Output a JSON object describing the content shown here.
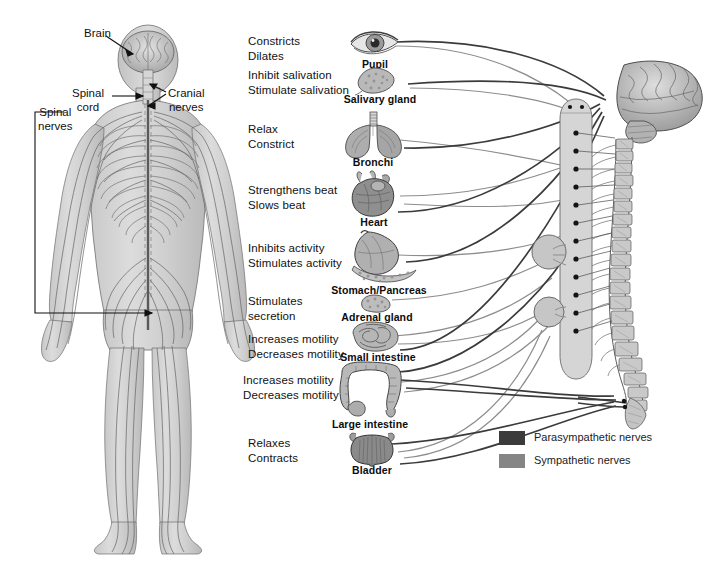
{
  "figure": {
    "body_figure": {
      "name": "human-nervous-system-posterior-view",
      "labels": [
        {
          "id": "brain",
          "text": "Brain",
          "x": 84,
          "y": 26
        },
        {
          "id": "spinal-cord",
          "text": "Spinal\ncord",
          "x": 79,
          "y": 86
        },
        {
          "id": "cranial-nerves",
          "text": "Cranial\nnerves",
          "x": 170,
          "y": 86
        },
        {
          "id": "spinal-nerves",
          "text": "Spinal\nnerves",
          "x": 40,
          "y": 105
        }
      ]
    },
    "organs": [
      {
        "id": "pupil",
        "name": "Pupil",
        "effects": [
          "Constricts",
          "Dilates"
        ],
        "icon": "eye-icon",
        "label_y": 36,
        "organ_y": 32,
        "name_y": 61
      },
      {
        "id": "salivary-gland",
        "name": "Salivary gland",
        "effects": [
          "Inhibit salivation",
          "Stimulate salivation"
        ],
        "icon": "salivary-gland-icon",
        "label_y": 70,
        "organ_y": 66,
        "name_y": 96
      },
      {
        "id": "bronchi",
        "name": "Bronchi",
        "effects": [
          "Relax",
          "Constrict"
        ],
        "icon": "lungs-icon",
        "label_y": 124,
        "organ_y": 112,
        "name_y": 160
      },
      {
        "id": "heart",
        "name": "Heart",
        "effects": [
          "Strengthens beat",
          "Slows beat"
        ],
        "icon": "heart-icon",
        "label_y": 185,
        "organ_y": 172,
        "name_y": 219
      },
      {
        "id": "stomach-pancreas",
        "name": "Stomach/Pancreas",
        "effects": [
          "Inhibits activity",
          "Stimulates activity"
        ],
        "icon": "stomach-icon",
        "label_y": 243,
        "organ_y": 233,
        "name_y": 288
      },
      {
        "id": "adrenal-gland",
        "name": "Adrenal gland",
        "effects": [
          "Stimulates",
          "secretion"
        ],
        "icon": "adrenal-gland-icon",
        "label_y": 296,
        "organ_y": 293,
        "name_y": 314
      },
      {
        "id": "small-intestine",
        "name": "Small intestine",
        "effects": [
          "Increases motility",
          "Decreases motility"
        ],
        "icon": "small-intestine-icon",
        "label_y": 334,
        "organ_y": 322,
        "name_y": 354
      },
      {
        "id": "large-intestine",
        "name": "Large intestine",
        "effects": [
          "Increases motility",
          "Decreases motility"
        ],
        "icon": "large-intestine-icon",
        "label_y": 375,
        "organ_y": 362,
        "name_y": 421
      },
      {
        "id": "bladder",
        "name": "Bladder",
        "effects": [
          "Relaxes",
          "Contracts"
        ],
        "icon": "bladder-icon",
        "label_y": 438,
        "organ_y": 430,
        "name_y": 467
      }
    ],
    "cns_column": {
      "brain": {
        "name": "brain-icon"
      },
      "spinal_cord": {
        "name": "spinal-cord-icon",
        "segment_count": 14
      },
      "vertebral_column": {
        "name": "vertebral-column-icon",
        "vertebra_count": 20
      },
      "ganglia": [
        {
          "id": "celiac-ganglion",
          "cx": 549,
          "cy": 252,
          "r": 17
        },
        {
          "id": "inferior-mesenteric-ganglion",
          "cx": 549,
          "cy": 312,
          "r": 15
        }
      ]
    },
    "legend": {
      "items": [
        {
          "id": "parasympathetic",
          "label": "Parasympathetic nerves",
          "color": "#3b3b3b"
        },
        {
          "id": "sympathetic",
          "label": "Sympathetic nerves",
          "color": "#858585"
        }
      ],
      "swatch_x": 499,
      "label_x": 534,
      "rows_y": [
        431,
        454
      ]
    },
    "colors": {
      "background": "#ffffff",
      "text": "#111111",
      "parasympathetic": "#3b3b3b",
      "sympathetic": "#8d8d8d",
      "organ_fill_light": "#cfcfcf",
      "organ_fill_mid": "#a8a8a8",
      "organ_fill_dark": "#7d7d7d",
      "outline": "#4a4a4a"
    }
  }
}
